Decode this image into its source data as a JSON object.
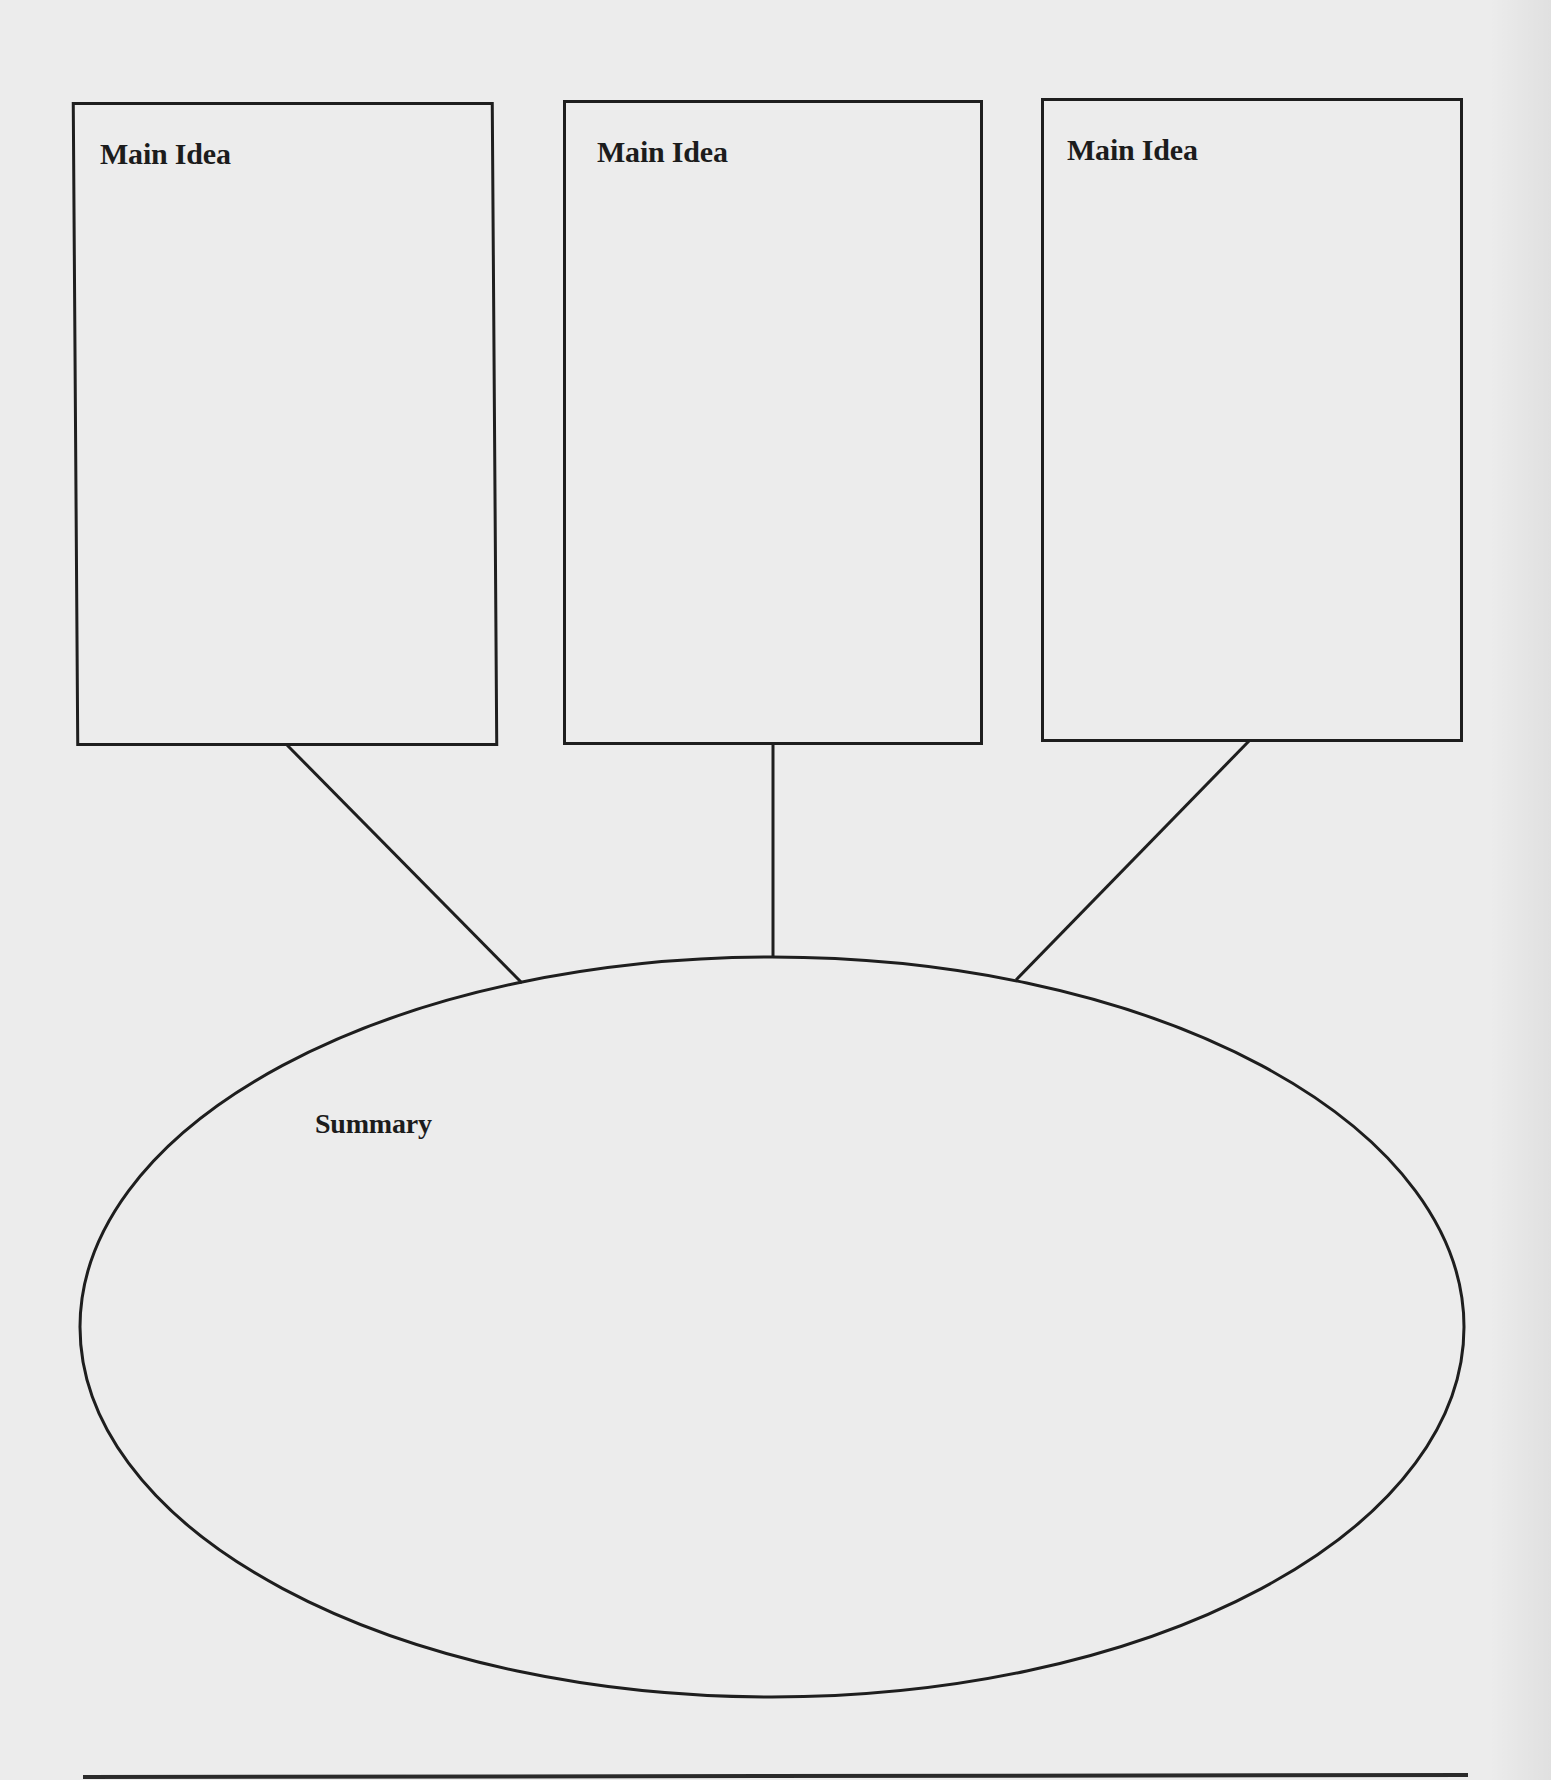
{
  "diagram": {
    "type": "main-idea-summary-organizer",
    "colors": {
      "background": "#ececec",
      "stroke": "#1e1e1e",
      "text": "#1c1c1c"
    },
    "main_ideas": [
      {
        "label": "Main Idea",
        "content": ""
      },
      {
        "label": "Main Idea",
        "content": ""
      },
      {
        "label": "Main Idea",
        "content": ""
      }
    ],
    "summary": {
      "label": "Summary",
      "content": ""
    }
  }
}
